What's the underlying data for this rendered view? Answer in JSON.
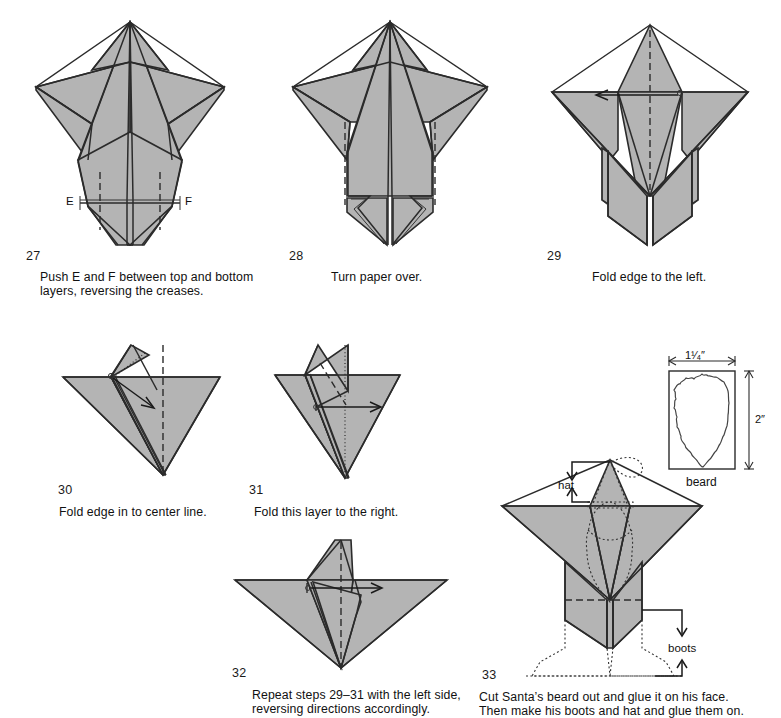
{
  "page": {
    "paper_fill": "#b4b4b4",
    "line_color": "#2b2b2b"
  },
  "steps": [
    {
      "number": "27",
      "caption": "Push E and F between top and bottom\nlayers, reversing the creases.",
      "labels": [
        "E",
        "F"
      ]
    },
    {
      "number": "28",
      "caption": "Turn paper over.",
      "labels": []
    },
    {
      "number": "29",
      "caption": "Fold edge to the left.",
      "labels": []
    },
    {
      "number": "30",
      "caption": "Fold edge in to center line.",
      "labels": []
    },
    {
      "number": "31",
      "caption": "Fold this layer to the right.",
      "labels": []
    },
    {
      "number": "32",
      "caption": "Repeat steps 29–31 with the left side,\nreversing directions accordingly.",
      "labels": []
    },
    {
      "number": "33",
      "caption": "Cut Santa’s beard out and glue it on his face.\nThen make his boots and hat and glue them on.",
      "labels": [
        "hat",
        "boots"
      ]
    }
  ],
  "inset": {
    "name": "beard",
    "label": "beard",
    "width_label": "1¹⁄₄″",
    "width_label_plain": "1 1/4\"",
    "height_label": "2″",
    "height_label_plain": "2\""
  },
  "labels": {
    "E": "E",
    "F": "F",
    "hat": "hat",
    "boots": "boots",
    "beard": "beard",
    "dim_width": "1¹⁄₄″",
    "dim_height": "2″"
  }
}
